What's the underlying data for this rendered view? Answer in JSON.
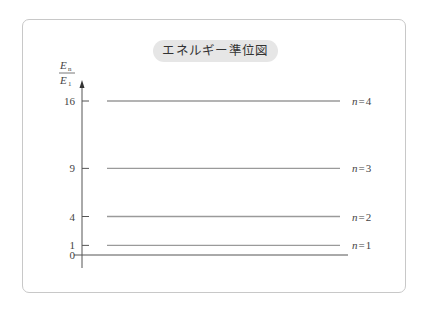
{
  "title": "エネルギー準位図",
  "chart_data": {
    "type": "energy-level-diagram",
    "title": "エネルギー準位図",
    "ylabel": {
      "numerator": "E",
      "numerator_sub": "n",
      "denominator": "E",
      "denominator_sub": "1"
    },
    "ylim": [
      0,
      16
    ],
    "yticks": [
      {
        "value": 0,
        "label": "0"
      },
      {
        "value": 1,
        "label": "1"
      },
      {
        "value": 4,
        "label": "4"
      },
      {
        "value": 9,
        "label": "9"
      },
      {
        "value": 16,
        "label": "16"
      }
    ],
    "levels": [
      {
        "n": 1,
        "value": 1,
        "label_var": "n",
        "label_eq": "=",
        "label_num": "1"
      },
      {
        "n": 2,
        "value": 4,
        "label_var": "n",
        "label_eq": "=",
        "label_num": "2"
      },
      {
        "n": 3,
        "value": 9,
        "label_var": "n",
        "label_eq": "=",
        "label_num": "3"
      },
      {
        "n": 4,
        "value": 16,
        "label_var": "n",
        "label_eq": "=",
        "label_num": "4"
      }
    ],
    "colors": {
      "axis": "#555555",
      "level_line": "#9a9a9a",
      "text": "#444444"
    }
  }
}
